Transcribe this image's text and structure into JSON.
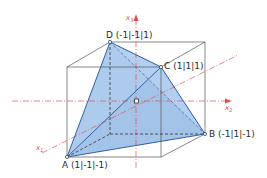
{
  "diagram": {
    "type": "tetrahedron-in-cube",
    "colors": {
      "cube_edge": "#555555",
      "hidden_edge": "#333333",
      "face_fill": "#a9c8ec",
      "edge": "#2f5fa8",
      "axis": "#e05050",
      "point_fill": "#ffffff"
    },
    "axes": [
      {
        "id": "x1",
        "label": "x",
        "sub": "1"
      },
      {
        "id": "x2",
        "label": "x",
        "sub": "2"
      },
      {
        "id": "x3",
        "label": "x",
        "sub": "3"
      }
    ],
    "points": [
      {
        "id": "A",
        "label": "A (1|-1|-1)"
      },
      {
        "id": "B",
        "label": "B (-1|1|-1)"
      },
      {
        "id": "C",
        "label": "C (1|1|1)"
      },
      {
        "id": "D",
        "label": "D (-1|-1|1)"
      }
    ]
  }
}
